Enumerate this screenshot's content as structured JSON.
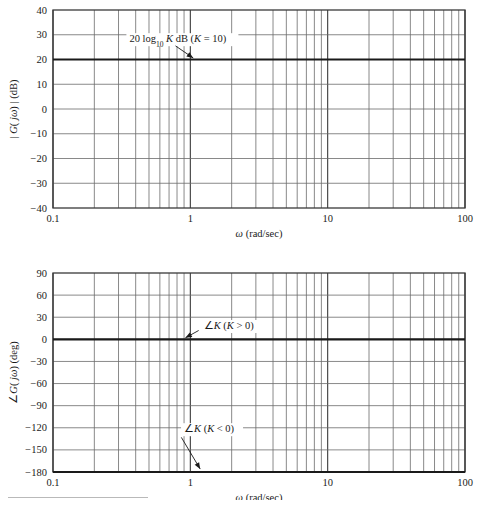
{
  "figure": {
    "background_color": "#ffffff",
    "frame_color": "#3a3a3a",
    "grid_color": "#6b6b6b",
    "curve_color": "#1a1a1a",
    "footrule": true
  },
  "chart_data": [
    {
      "type": "line",
      "name": "magnitude-plot",
      "title": "",
      "xlabel": "ω (rad/sec)",
      "ylabel": "| G( jω) | (dB)",
      "xscale": "log",
      "xlim": [
        0.1,
        100
      ],
      "ylim": [
        -40,
        40
      ],
      "xticks": [
        0.1,
        1,
        10,
        100
      ],
      "xtick_labels": [
        "0.1",
        "1",
        "10",
        "100"
      ],
      "yticks": [
        40,
        30,
        20,
        10,
        0,
        -10,
        -20,
        -30,
        -40
      ],
      "ytick_labels": [
        "40",
        "30",
        "20",
        "10",
        "0",
        "−10",
        "−20",
        "−30",
        "−40"
      ],
      "grid": true,
      "legend": "none",
      "series": [
        {
          "name": "20 log10 K dB (K = 10)",
          "x": [
            0.1,
            100
          ],
          "values": [
            20,
            20
          ],
          "style": "bold-horizontal"
        }
      ],
      "annotations": [
        {
          "id": "magnitude-annotation",
          "text": "20 log10 K dB (K = 10)",
          "text_parts": {
            "lead": "20 log",
            "sub": "10",
            "k": "K",
            "unit": " dB (",
            "k2": "K",
            "eq": " = 10)"
          },
          "text_x": 0.36,
          "text_y": 27,
          "arrow_from": [
            0.78,
            25.5
          ],
          "arrow_to": [
            1.05,
            20.6
          ]
        }
      ]
    },
    {
      "type": "line",
      "name": "phase-plot",
      "title": "",
      "xlabel": "ω (rad/sec)",
      "ylabel": "∠G( jω) (deg)",
      "xscale": "log",
      "xlim": [
        0.1,
        100
      ],
      "ylim": [
        -180,
        90
      ],
      "xticks": [
        0.1,
        1,
        10,
        100
      ],
      "xtick_labels": [
        "0.1",
        "1",
        "10",
        "100"
      ],
      "yticks": [
        90,
        60,
        30,
        0,
        -30,
        -60,
        -90,
        -120,
        -150,
        -180
      ],
      "ytick_labels": [
        "90",
        "60",
        "30",
        "0",
        "−30",
        "−60",
        "−90",
        "−120",
        "−150",
        "−180"
      ],
      "grid": true,
      "legend": "none",
      "series": [
        {
          "name": "∠K (K > 0)",
          "x": [
            0.1,
            100
          ],
          "values": [
            0,
            0
          ],
          "style": "bold-horizontal"
        },
        {
          "name": "∠K (K < 0)",
          "x": [
            0.1,
            100
          ],
          "values": [
            -180,
            -180
          ],
          "style": "bold-horizontal"
        }
      ],
      "annotations": [
        {
          "id": "phase-annotation-positive",
          "text": "∠K (K > 0)",
          "text_parts": {
            "angle": "∠",
            "k": "K",
            "cond": " (",
            "k2": "K",
            "rel": " > 0)"
          },
          "text_x": 1.25,
          "text_y": 14,
          "arrow_from": [
            1.15,
            12
          ],
          "arrow_to": [
            0.92,
            2
          ]
        },
        {
          "id": "phase-annotation-negative",
          "text": "∠K (K < 0)",
          "text_parts": {
            "angle": "∠",
            "k": "K",
            "cond": " (",
            "k2": "K",
            "rel": " < 0)"
          },
          "text_x": 0.9,
          "text_y": -126,
          "arrow_from": [
            0.86,
            -133
          ],
          "arrow_to": [
            1.18,
            -176
          ]
        }
      ]
    }
  ]
}
